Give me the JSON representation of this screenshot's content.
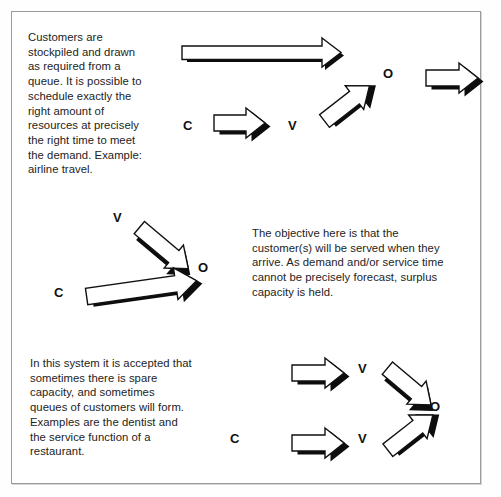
{
  "figure": {
    "background_color": "#ffffff",
    "frame_color": "#9a9a9a",
    "ink_color": "#111111"
  },
  "panels": [
    {
      "id": "level-capacity",
      "text": "Customers are\nstockpiled and drawn\nas required from a\nqueue. It is possible to\nschedule exactly the\nright amount of\nresources at precisely\nthe right time to meet\nthe demand. Example:\nairline travel.",
      "labels": [
        {
          "name": "label-c",
          "text": "C"
        },
        {
          "name": "label-v",
          "text": "V"
        },
        {
          "name": "label-o",
          "text": "O"
        }
      ]
    },
    {
      "id": "chase-capacity",
      "text": "The objective here is that the\ncustomer(s) will be served when they\narrive. As demand and/or service time\ncannot be precisely forecast, surplus\ncapacity is held.",
      "labels": [
        {
          "name": "label-c",
          "text": "C"
        },
        {
          "name": "label-v",
          "text": "V"
        },
        {
          "name": "label-o",
          "text": "O"
        }
      ]
    },
    {
      "id": "mixed-capacity",
      "text": "In this system it is accepted that\nsometimes there is spare\ncapacity, and sometimes\nqueues of customers will form.\nExamples are the dentist and\nthe service function of a\nrestaurant.",
      "labels": [
        {
          "name": "label-c",
          "text": "C"
        },
        {
          "name": "label-v-top",
          "text": "V"
        },
        {
          "name": "label-v-bottom",
          "text": "V"
        },
        {
          "name": "label-o",
          "text": "O"
        }
      ]
    }
  ],
  "glyphs": {
    "c": "C",
    "v": "V",
    "o": "O"
  }
}
